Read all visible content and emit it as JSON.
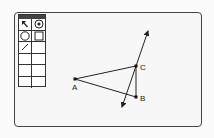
{
  "toolbox": {
    "tools": [
      {
        "name": "pointer-tool",
        "icon": "arrow"
      },
      {
        "name": "point-tool",
        "icon": "circle-dot"
      },
      {
        "name": "circle-tool",
        "icon": "circle"
      },
      {
        "name": "square-tool",
        "icon": "square"
      },
      {
        "name": "line-tool",
        "icon": "line"
      },
      {
        "name": "empty-tool-1",
        "icon": ""
      },
      {
        "name": "empty-tool-2",
        "icon": ""
      },
      {
        "name": "empty-tool-3",
        "icon": ""
      },
      {
        "name": "empty-tool-4",
        "icon": ""
      },
      {
        "name": "empty-tool-5",
        "icon": ""
      },
      {
        "name": "empty-tool-6",
        "icon": ""
      },
      {
        "name": "empty-tool-7",
        "icon": ""
      }
    ],
    "selected": "point-tool"
  },
  "diagram": {
    "points": [
      {
        "label": "A",
        "x": 75,
        "y": 79
      },
      {
        "label": "B",
        "x": 136,
        "y": 97
      },
      {
        "label": "C",
        "x": 136,
        "y": 66
      }
    ],
    "segments": [
      [
        "A",
        "C"
      ],
      [
        "A",
        "B"
      ],
      [
        "C",
        "B"
      ]
    ],
    "line": {
      "through": [
        "C"
      ],
      "from": [
        122,
        107
      ],
      "to": [
        148,
        31
      ]
    }
  }
}
